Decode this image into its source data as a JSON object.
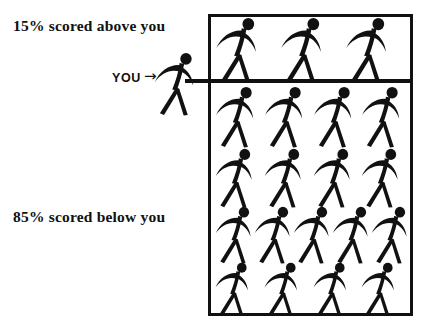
{
  "figure": {
    "title_above": "15% scored above you",
    "title_below": "85% scored below you",
    "you_label": "YOU",
    "you_arrow_icon": "→",
    "colors": {
      "ink": "#111111",
      "background": "#ffffff"
    }
  },
  "chart_data": {
    "type": "bar",
    "xlabel": "",
    "ylabel": "",
    "categories": [
      "scored above you",
      "scored below you"
    ],
    "values": [
      15,
      85
    ],
    "value_labels": [
      "15% scored above you",
      "85% scored below you"
    ],
    "units": "percent",
    "marker": {
      "label": "YOU",
      "percentile": 85,
      "description": "Stick figure positioned at the dividing line between the top 15% and the bottom 85%"
    },
    "legend": "none",
    "grid": false,
    "icon_rows": [
      {
        "band": "above",
        "count": 3
      },
      {
        "band": "below",
        "count": 4
      },
      {
        "band": "below",
        "count": 4
      },
      {
        "band": "below",
        "count": 5
      },
      {
        "band": "below",
        "count": 4
      }
    ],
    "icon_total_above": 3,
    "icon_total_below": 17
  }
}
